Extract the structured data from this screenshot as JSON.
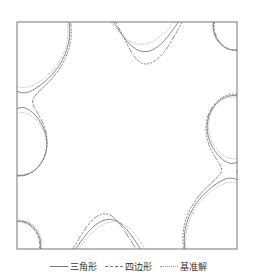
{
  "chart_data": {
    "type": "contour",
    "title": "",
    "xlabel": "",
    "ylabel": "",
    "grid": false,
    "legend_position": "bottom",
    "plot_box_px": {
      "x": 17,
      "y": 22,
      "width": 220,
      "height": 227
    },
    "legend": [
      {
        "label": "三角形",
        "style": "solid"
      },
      {
        "label": "四边形",
        "style": "dashed"
      },
      {
        "label": "基准解",
        "style": "dotted"
      }
    ],
    "field_sources": [
      {
        "x": 0.0,
        "y": 0.0,
        "strength": 1.0
      },
      {
        "x": 1.0,
        "y": 1.0,
        "strength": 1.0
      },
      {
        "x": 1.0,
        "y": 0.0,
        "strength": 0.45
      },
      {
        "x": 0.0,
        "y": 1.0,
        "strength": 0.45
      },
      {
        "x": 0.0,
        "y": 0.55,
        "strength": 0.35
      },
      {
        "x": 1.0,
        "y": 0.45,
        "strength": 0.35
      }
    ],
    "levels": [
      0.28,
      0.34,
      0.4,
      0.47,
      0.55,
      0.64,
      0.74,
      0.86,
      1.0,
      1.18,
      1.4,
      1.7,
      2.1
    ]
  },
  "colors": {
    "line": "#6a6a6a",
    "dotted": "#9a9a9a",
    "frame": "#777777"
  }
}
